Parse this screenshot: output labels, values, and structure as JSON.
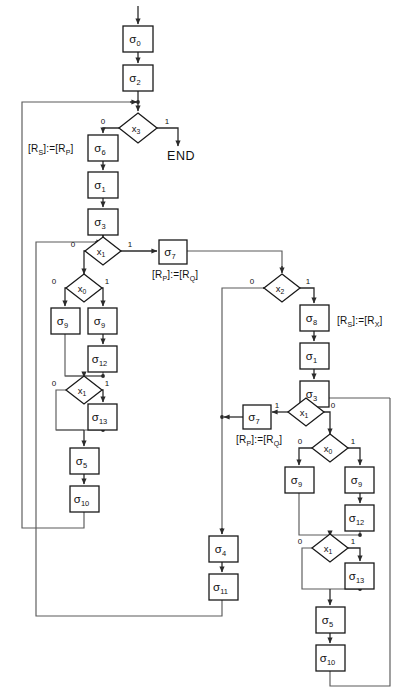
{
  "page": {
    "corner_mark": ""
  },
  "diagram": {
    "type": "flowchart",
    "operators": [
      {
        "id": "s0",
        "base": "σ",
        "sub": "0",
        "x": 123,
        "y": 26,
        "w": 30,
        "h": 26
      },
      {
        "id": "s2",
        "base": "σ",
        "sub": "2",
        "x": 123,
        "y": 65,
        "w": 30,
        "h": 26
      },
      {
        "id": "s6",
        "base": "σ",
        "sub": "6",
        "x": 88,
        "y": 135,
        "w": 30,
        "h": 26
      },
      {
        "id": "s1a",
        "base": "σ",
        "sub": "1",
        "x": 88,
        "y": 172,
        "w": 30,
        "h": 26
      },
      {
        "id": "s3a",
        "base": "σ",
        "sub": "3",
        "x": 88,
        "y": 209,
        "w": 30,
        "h": 26
      },
      {
        "id": "s7a",
        "base": "σ",
        "sub": "7",
        "x": 159,
        "y": 240,
        "w": 28,
        "h": 24
      },
      {
        "id": "s9L",
        "base": "σ",
        "sub": "9",
        "x": 51,
        "y": 308,
        "w": 29,
        "h": 26
      },
      {
        "id": "s9R",
        "base": "σ",
        "sub": "9",
        "x": 88,
        "y": 308,
        "w": 29,
        "h": 26
      },
      {
        "id": "s12",
        "base": "σ",
        "sub": "12",
        "x": 88,
        "y": 346,
        "w": 29,
        "h": 26
      },
      {
        "id": "s13",
        "base": "σ",
        "sub": "13",
        "x": 88,
        "y": 404,
        "w": 29,
        "h": 26
      },
      {
        "id": "s5",
        "base": "σ",
        "sub": "5",
        "x": 70,
        "y": 448,
        "w": 29,
        "h": 26
      },
      {
        "id": "s10",
        "base": "σ",
        "sub": "10",
        "x": 70,
        "y": 486,
        "w": 29,
        "h": 26
      },
      {
        "id": "s4",
        "base": "σ",
        "sub": "4",
        "x": 209,
        "y": 536,
        "w": 29,
        "h": 26
      },
      {
        "id": "s11",
        "base": "σ",
        "sub": "11",
        "x": 209,
        "y": 574,
        "w": 29,
        "h": 26
      },
      {
        "id": "s8",
        "base": "σ",
        "sub": "8",
        "x": 300,
        "y": 305,
        "w": 29,
        "h": 26
      },
      {
        "id": "s1b",
        "base": "σ",
        "sub": "1",
        "x": 300,
        "y": 343,
        "w": 29,
        "h": 26
      },
      {
        "id": "s3b",
        "base": "σ",
        "sub": "3",
        "x": 300,
        "y": 381,
        "w": 29,
        "h": 26
      },
      {
        "id": "s7b",
        "base": "σ",
        "sub": "7",
        "x": 243,
        "y": 405,
        "w": 28,
        "h": 24
      },
      {
        "id": "s9L2",
        "base": "σ",
        "sub": "9",
        "x": 285,
        "y": 467,
        "w": 29,
        "h": 26
      },
      {
        "id": "s9R2",
        "base": "σ",
        "sub": "9",
        "x": 345,
        "y": 467,
        "w": 29,
        "h": 26
      },
      {
        "id": "s12b",
        "base": "σ",
        "sub": "12",
        "x": 345,
        "y": 505,
        "w": 29,
        "h": 26
      },
      {
        "id": "s13b",
        "base": "σ",
        "sub": "13",
        "x": 345,
        "y": 563,
        "w": 29,
        "h": 26
      },
      {
        "id": "s5b",
        "base": "σ",
        "sub": "5",
        "x": 316,
        "y": 607,
        "w": 29,
        "h": 26
      },
      {
        "id": "s10b",
        "base": "σ",
        "sub": "10",
        "x": 316,
        "y": 645,
        "w": 29,
        "h": 26
      }
    ],
    "conditions": [
      {
        "id": "x3",
        "base": "x",
        "sub": "3",
        "cx": 138,
        "cy": 128,
        "rx": 19,
        "ry": 15
      },
      {
        "id": "x1a",
        "base": "x",
        "sub": "1",
        "cx": 103,
        "cy": 251,
        "rx": 18,
        "ry": 14
      },
      {
        "id": "x0a",
        "base": "x",
        "sub": "0",
        "cx": 84,
        "cy": 288,
        "rx": 18,
        "ry": 14
      },
      {
        "id": "x1b",
        "base": "x",
        "sub": "1",
        "cx": 84,
        "cy": 390,
        "rx": 18,
        "ry": 14
      },
      {
        "id": "x2",
        "base": "x",
        "sub": "2",
        "cx": 282,
        "cy": 288,
        "rx": 18,
        "ry": 14
      },
      {
        "id": "x1c",
        "base": "x",
        "sub": "1",
        "cx": 306,
        "cy": 412,
        "rx": 18,
        "ry": 14
      },
      {
        "id": "x0b",
        "base": "x",
        "sub": "0",
        "cx": 330,
        "cy": 448,
        "rx": 18,
        "ry": 14
      },
      {
        "id": "x1d",
        "base": "x",
        "sub": "1",
        "cx": 330,
        "cy": 548,
        "rx": 18,
        "ry": 14
      }
    ],
    "branch_labels": [
      {
        "id": "x3-0",
        "text": "0",
        "x": 103,
        "y": 124
      },
      {
        "id": "x3-1",
        "text": "1",
        "x": 167,
        "y": 124
      },
      {
        "id": "x1a-0",
        "text": "0",
        "x": 73,
        "y": 247
      },
      {
        "id": "x1a-1",
        "text": "1",
        "x": 130,
        "y": 247
      },
      {
        "id": "x0a-0",
        "text": "0",
        "x": 54,
        "y": 284
      },
      {
        "id": "x0a-1",
        "text": "1",
        "x": 107,
        "y": 284
      },
      {
        "id": "x1b-0",
        "text": "0",
        "x": 54,
        "y": 386
      },
      {
        "id": "x1b-1",
        "text": "1",
        "x": 107,
        "y": 386
      },
      {
        "id": "x2-0",
        "text": "0",
        "x": 252,
        "y": 284
      },
      {
        "id": "x2-1",
        "text": "1",
        "x": 308,
        "y": 284
      },
      {
        "id": "x1c-1",
        "text": "1",
        "x": 277,
        "y": 408
      },
      {
        "id": "x1c-0",
        "text": "0",
        "x": 333,
        "y": 408
      },
      {
        "id": "x0b-0",
        "text": "0",
        "x": 300,
        "y": 444
      },
      {
        "id": "x0b-1",
        "text": "1",
        "x": 353,
        "y": 444
      },
      {
        "id": "x1d-0",
        "text": "0",
        "x": 300,
        "y": 544
      },
      {
        "id": "x1d-1",
        "text": "1",
        "x": 353,
        "y": 544
      }
    ],
    "assignments": [
      {
        "id": "assign-rs-rp",
        "x": 28,
        "y": 152,
        "lb": "[",
        "r": "R",
        "rsub": "S",
        "rb": "]",
        "op": ":=",
        "lb2": "[",
        "r2": "R",
        "rsub2": "P",
        "rb2": "]"
      },
      {
        "id": "assign-rp-rq-upper",
        "x": 152,
        "y": 278,
        "lb": "[",
        "r": "R",
        "rsub": "P",
        "rb": "]",
        "op": ":=",
        "lb2": "[",
        "r2": "R",
        "rsub2": "Q",
        "rb2": "]"
      },
      {
        "id": "assign-rs-rx",
        "x": 337,
        "y": 324,
        "lb": "[",
        "r": "R",
        "rsub": "S",
        "rb": "]",
        "op": ":=",
        "lb2": "[",
        "r2": "R",
        "rsub2": "X",
        "rb2": "]"
      },
      {
        "id": "assign-rp-rq-lower",
        "x": 236,
        "y": 443,
        "lb": "[",
        "r": "R",
        "rsub": "P",
        "rb": "]",
        "op": ":=",
        "lb2": "[",
        "r2": "R",
        "rsub2": "Q",
        "rb2": "]"
      }
    ],
    "terminals": [
      {
        "id": "end",
        "text": "END",
        "x": 167,
        "y": 160
      }
    ]
  }
}
